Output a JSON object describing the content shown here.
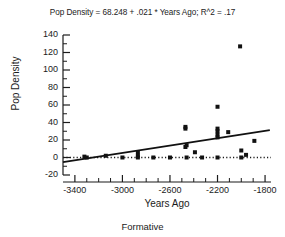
{
  "chart_data": {
    "type": "scatter",
    "title": "Pop Density = 68.248 + .021 * Years Ago; R^2 = .17",
    "caption": "Formative",
    "xlabel": "Years Ago",
    "ylabel": "Pop Density",
    "grid": false,
    "legend": "none",
    "xlim": [
      -3500,
      -1750
    ],
    "ylim": [
      -20,
      140
    ],
    "xticks": [
      -3400,
      -3000,
      -2600,
      -2200,
      -1800
    ],
    "xtick_labels": [
      "-3400",
      "-3000",
      "-2600",
      "-2200",
      "-1800"
    ],
    "xminor_step": 100,
    "yticks": [
      -20,
      0,
      20,
      40,
      60,
      80,
      100,
      120,
      140
    ],
    "ytick_labels": [
      "-20",
      "0",
      "20",
      "40",
      "60",
      "80",
      "100",
      "120",
      "140"
    ],
    "yminor_step": 10,
    "zero_line": {
      "y": 0,
      "style": "dotted"
    },
    "regression": {
      "intercept": 68.248,
      "slope": 0.021,
      "r_squared": 0.17,
      "x_start": -3500,
      "x_end": -1760
    },
    "points": [
      {
        "x": -3320,
        "y": 1
      },
      {
        "x": -3300,
        "y": 0
      },
      {
        "x": -3140,
        "y": 2
      },
      {
        "x": -3000,
        "y": 0
      },
      {
        "x": -2870,
        "y": 6
      },
      {
        "x": -2870,
        "y": 2
      },
      {
        "x": -2870,
        "y": 0
      },
      {
        "x": -2740,
        "y": 0
      },
      {
        "x": -2600,
        "y": 0
      },
      {
        "x": -2470,
        "y": 35
      },
      {
        "x": -2470,
        "y": 33
      },
      {
        "x": -2470,
        "y": 12
      },
      {
        "x": -2460,
        "y": 14
      },
      {
        "x": -2460,
        "y": 0
      },
      {
        "x": -2390,
        "y": 6
      },
      {
        "x": -2330,
        "y": 0
      },
      {
        "x": -2200,
        "y": 58
      },
      {
        "x": -2200,
        "y": 33
      },
      {
        "x": -2200,
        "y": 30
      },
      {
        "x": -2200,
        "y": 26
      },
      {
        "x": -2200,
        "y": 23
      },
      {
        "x": -2200,
        "y": 0
      },
      {
        "x": -2110,
        "y": 29
      },
      {
        "x": -2010,
        "y": 127
      },
      {
        "x": -2000,
        "y": 8
      },
      {
        "x": -2000,
        "y": 0
      },
      {
        "x": -1960,
        "y": 3
      },
      {
        "x": -1890,
        "y": 19
      }
    ]
  },
  "axes": {
    "title": "Pop Density = 68.248 + .021 * Years Ago; R^2 = .17",
    "ylabel": "Pop Density",
    "xlabel": "Years Ago",
    "caption": "Formative"
  },
  "colors": {
    "axis": "#1b1b1b",
    "point": "#111111",
    "line": "#111111",
    "background": "#ffffff"
  }
}
